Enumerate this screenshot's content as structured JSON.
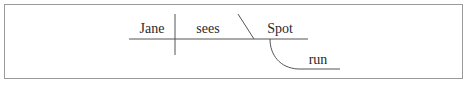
{
  "diagram": {
    "type": "sentence-diagram",
    "sentence_parts": {
      "subject": "Jane",
      "verb": "sees",
      "object": "Spot",
      "object_complement": "run"
    },
    "colors": {
      "frame": "#9a9a9a",
      "lines": "#555555",
      "text": "#2a2a2a"
    }
  }
}
